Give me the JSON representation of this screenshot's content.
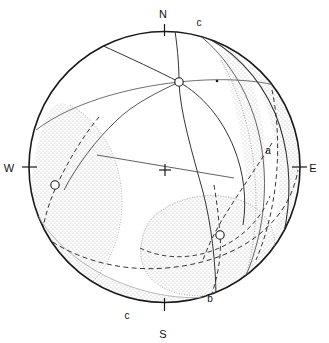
{
  "figure": {
    "type": "stereographic-projection",
    "background_color": "#ffffff",
    "line_color": "#1a1a1a",
    "shade_color": "#e9e9e9",
    "shade_dot_color": "#b9b9b9",
    "primitive_circle": {
      "center_x": 164.5,
      "center_y": 167,
      "radius": 136
    }
  },
  "cardinals": [
    {
      "name": "north",
      "label": "N",
      "x": 163,
      "y": 18,
      "tick_x1": 164.5,
      "tick_y1": 24,
      "tick_x2": 164.5,
      "tick_y2": 36
    },
    {
      "name": "south",
      "label": "S",
      "x": 163,
      "y": 338,
      "tick_x1": 164.5,
      "tick_y1": 298,
      "tick_x2": 164.5,
      "tick_y2": 311
    },
    {
      "name": "east",
      "label": "E",
      "x": 313,
      "y": 172,
      "tick_x1": 292,
      "tick_y1": 167,
      "tick_x2": 307,
      "tick_y2": 167
    },
    {
      "name": "west",
      "label": "W",
      "x": 9,
      "y": 172,
      "tick_x1": 22,
      "tick_y1": 167,
      "tick_x2": 37,
      "tick_y2": 167
    }
  ],
  "plane_labels": [
    {
      "name": "c-top",
      "label": "c",
      "x": 199,
      "y": 26
    },
    {
      "name": "c-bottom",
      "label": "c",
      "x": 127,
      "y": 319
    },
    {
      "name": "a-right",
      "label": "a",
      "x": 268,
      "y": 154
    },
    {
      "name": "b-bottom",
      "label": "b",
      "x": 210,
      "y": 302
    }
  ],
  "points": [
    {
      "name": "pole-upper",
      "x": 179,
      "y": 82,
      "r": 4.2,
      "style": "open-circle"
    },
    {
      "name": "pole-left",
      "x": 55,
      "y": 185,
      "r": 4.2,
      "style": "open-circle"
    },
    {
      "name": "pole-lower",
      "x": 220,
      "y": 235,
      "r": 4.2,
      "style": "open-circle"
    },
    {
      "name": "tick-dot",
      "x": 217,
      "y": 81,
      "r": 1.3,
      "style": "filled-dot"
    }
  ],
  "center_cross": {
    "name": "origin-cross",
    "x": 165,
    "y": 170,
    "arm": 6
  }
}
